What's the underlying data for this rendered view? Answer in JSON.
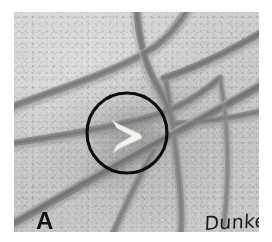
{
  "figure": {
    "panel_label": "A",
    "handwritten_caption": "Dunker",
    "image_type": "grayscale micrograph photograph",
    "background_color": "#c9c9c9",
    "fiber_color": "#8a8a8a",
    "annotation_circle": {
      "name": "region-of-interest-circle",
      "color": "#0d0d0d",
      "center_x_pct": 46,
      "center_y_pct": 55,
      "radius_pct": 17,
      "stroke_width_px": 3
    },
    "annotation_arrowhead": {
      "name": "arrowhead-marker",
      "color": "#f2f0ea",
      "shape": "chevron pointing right",
      "center_x_pct": 47,
      "center_y_pct": 54
    },
    "plate": {
      "left_px": 14,
      "top_px": 12,
      "width_px": 245,
      "height_px": 220
    },
    "fibers": [
      {
        "name": "fiber-upper-left-diagonal",
        "path": "M -6 96 C 40 78, 96 62, 132 40 C 150 30, 164 14, 176 -8",
        "width": 7.5,
        "shade": "#8e8e8e"
      },
      {
        "name": "fiber-left-to-center",
        "path": "M -6 132 C 46 124, 92 116, 124 108 C 150 102, 176 92, 206 66",
        "width": 6.5,
        "shade": "#8a8a8a"
      },
      {
        "name": "fiber-lower-left-long",
        "path": "M -6 214 C 44 186, 96 156, 140 132 C 180 110, 214 92, 252 70",
        "width": 8.5,
        "shade": "#858585"
      },
      {
        "name": "fiber-top-vertical",
        "path": "M 122 -8 C 124 20, 128 46, 140 68 C 150 86, 158 100, 160 120",
        "width": 7.0,
        "shade": "#8b8b8b"
      },
      {
        "name": "fiber-center-to-bottom",
        "path": "M 152 70 C 158 104, 162 140, 166 176 C 168 200, 168 216, 166 228",
        "width": 6.0,
        "shade": "#909090"
      },
      {
        "name": "fiber-right-branch-upper",
        "path": "M 150 66 C 182 56, 214 40, 252 18",
        "width": 7.0,
        "shade": "#888888"
      },
      {
        "name": "fiber-right-branch-lower",
        "path": "M 158 112 C 190 110, 220 106, 252 98",
        "width": 6.0,
        "shade": "#8c8c8c"
      },
      {
        "name": "fiber-bottom-center-arc",
        "path": "M 96 228 C 110 196, 124 166, 140 138",
        "width": 6.0,
        "shade": "#8f8f8f"
      },
      {
        "name": "fiber-far-right-vertical",
        "path": "M 206 66 C 214 110, 216 160, 210 212",
        "width": 5.0,
        "shade": "#949494"
      }
    ]
  }
}
